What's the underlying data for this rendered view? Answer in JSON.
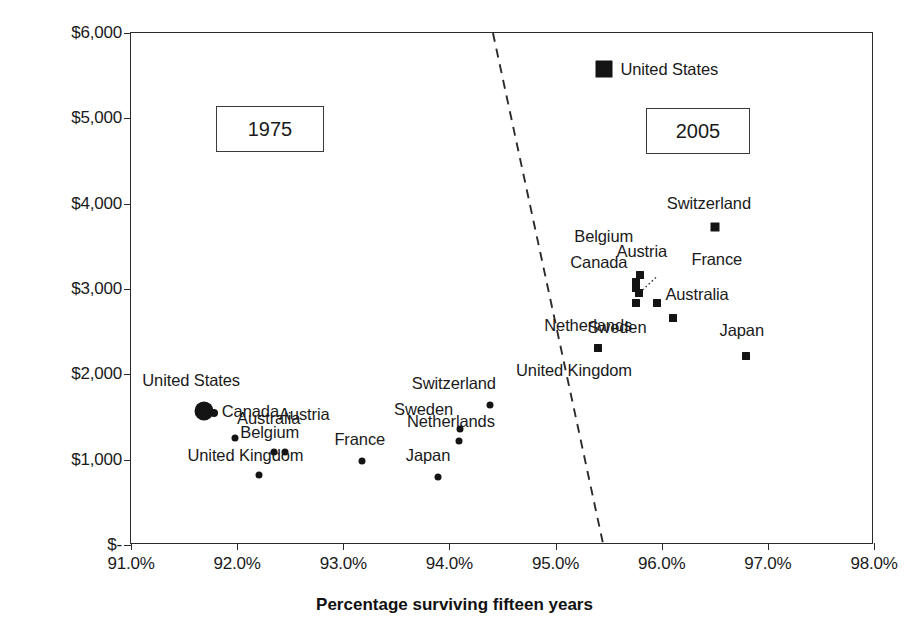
{
  "chart_data": {
    "type": "scatter",
    "title": "",
    "xlabel": "Percentage surviving fifteen years",
    "ylabel": "Per capita health spending (2005 US$ )",
    "xlim": [
      91.0,
      98.0
    ],
    "ylim": [
      0,
      6000
    ],
    "xticks": [
      "91.0%",
      "92.0%",
      "93.0%",
      "94.0%",
      "95.0%",
      "96.0%",
      "97.0%",
      "98.0%"
    ],
    "xtick_values": [
      91.0,
      92.0,
      93.0,
      94.0,
      95.0,
      96.0,
      97.0,
      98.0
    ],
    "yticks": [
      "$-",
      "$1,000",
      "$2,000",
      "$3,000",
      "$4,000",
      "$5,000",
      "$6,000"
    ],
    "ytick_values": [
      0,
      1000,
      2000,
      3000,
      4000,
      5000,
      6000
    ],
    "grid": false,
    "legend_position": "top-center",
    "series": [
      {
        "name": "1975",
        "marker": "circle",
        "points": [
          {
            "label": "United States",
            "x": 91.69,
            "y": 1575,
            "size": 19,
            "label_dx": -62,
            "label_dy": -31,
            "label_align": "left"
          },
          {
            "label": "Canada",
            "x": 91.78,
            "y": 1545,
            "size": 8,
            "label_dx": 8,
            "label_dy": -2,
            "label_align": "left"
          },
          {
            "label": "Australia",
            "x": 91.98,
            "y": 1250,
            "size": 7,
            "label_dx": 2,
            "label_dy": -20,
            "label_align": "left"
          },
          {
            "label": "Austria",
            "x": 92.45,
            "y": 1095,
            "size": 7,
            "label_dx": -6,
            "label_dy": -38,
            "label_align": "left"
          },
          {
            "label": "Belgium",
            "x": 92.35,
            "y": 1090,
            "size": 7,
            "label_dx": -34,
            "label_dy": -20,
            "label_align": "left"
          },
          {
            "label": "United Kingdom",
            "x": 92.21,
            "y": 820,
            "size": 7,
            "label_dx": -72,
            "label_dy": -20,
            "label_align": "left"
          },
          {
            "label": "France",
            "x": 93.18,
            "y": 985,
            "size": 7,
            "label_dx": -28,
            "label_dy": -22,
            "label_align": "left"
          },
          {
            "label": "Switzerland",
            "x": 94.38,
            "y": 1645,
            "size": 7,
            "label_dx": -78,
            "label_dy": -22,
            "label_align": "left"
          },
          {
            "label": "Sweden",
            "x": 94.1,
            "y": 1360,
            "size": 7,
            "label_dx": -66,
            "label_dy": -20,
            "label_align": "left"
          },
          {
            "label": "Netherlands",
            "x": 94.09,
            "y": 1215,
            "size": 7,
            "label_dx": -52,
            "label_dy": -20,
            "label_align": "left"
          },
          {
            "label": "Japan",
            "x": 93.89,
            "y": 800,
            "size": 7,
            "label_dx": -32,
            "label_dy": -22,
            "label_align": "left"
          }
        ]
      },
      {
        "name": "2005",
        "marker": "square",
        "points": [
          {
            "label": "United States",
            "x": 95.46,
            "y": 5580,
            "size": 17,
            "label_dx": 16,
            "label_dy": 0,
            "label_align": "left",
            "is_legend": true
          },
          {
            "label": "Switzerland",
            "x": 96.5,
            "y": 3725,
            "size": 9,
            "label_dx": -48,
            "label_dy": -24,
            "label_align": "left"
          },
          {
            "label": "Belgium",
            "x": 95.76,
            "y": 3080,
            "size": 8,
            "label_dx": -62,
            "label_dy": -46,
            "label_align": "left"
          },
          {
            "label": "Canada",
            "x": 95.76,
            "y": 3010,
            "size": 8,
            "label_dx": -66,
            "label_dy": -26,
            "label_align": "left"
          },
          {
            "label": "Austria",
            "x": 95.8,
            "y": 3165,
            "size": 8,
            "label_dx": -24,
            "label_dy": -24,
            "label_align": "left"
          },
          {
            "label": "France",
            "x": 95.79,
            "y": 2955,
            "size": 8,
            "label_dx": 52,
            "label_dy": -34,
            "label_align": "left"
          },
          {
            "label": "Netherlands",
            "x": 95.76,
            "y": 2835,
            "size": 8,
            "label_dx": -92,
            "label_dy": 22,
            "label_align": "left"
          },
          {
            "label": "Sweden",
            "x": 95.96,
            "y": 2835,
            "size": 8,
            "label_dx": -70,
            "label_dy": 24,
            "label_align": "left"
          },
          {
            "label": "Australia",
            "x": 96.11,
            "y": 2660,
            "size": 8,
            "label_dx": -8,
            "label_dy": -24,
            "label_align": "left"
          },
          {
            "label": "Japan",
            "x": 96.79,
            "y": 2210,
            "size": 8,
            "label_dx": -26,
            "label_dy": -26,
            "label_align": "left"
          },
          {
            "label": "United Kingdom",
            "x": 95.4,
            "y": 2310,
            "size": 8,
            "label_dx": -82,
            "label_dy": 22,
            "label_align": "left"
          }
        ]
      }
    ],
    "annotations": [
      {
        "kind": "era-box",
        "text": "1975",
        "x": 216,
        "y": 106,
        "w": 108,
        "h": 46
      },
      {
        "kind": "era-box",
        "text": "2005",
        "x": 646,
        "y": 108,
        "w": 104,
        "h": 46
      }
    ],
    "divider_line": {
      "style": "dashed",
      "x1": 94.41,
      "y1": 6000,
      "x2": 95.45,
      "y2": 0,
      "color": "#3a3a3a"
    },
    "leader_lines": [
      {
        "for": "France",
        "style": "dotted",
        "x1": 95.79,
        "y1": 2955,
        "x2": 95.95,
        "y2": 3140
      }
    ],
    "legend": [
      {
        "label": "United States",
        "marker": "square",
        "color": "#1d1d1d"
      }
    ],
    "colors": {
      "marker": "#141414",
      "axis": "#2b2b2b",
      "text": "#1a1a1a",
      "background": "#ffffff"
    }
  }
}
